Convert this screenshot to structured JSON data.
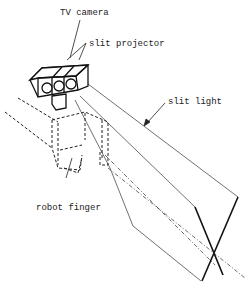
{
  "diagram": {
    "labels": {
      "tv_camera": "TV camera",
      "slit_projector": "slit projector",
      "slit_light": "slit light",
      "robot_finger": "robot finger"
    },
    "colors": {
      "line": "#222222",
      "background": "#ffffff"
    }
  }
}
